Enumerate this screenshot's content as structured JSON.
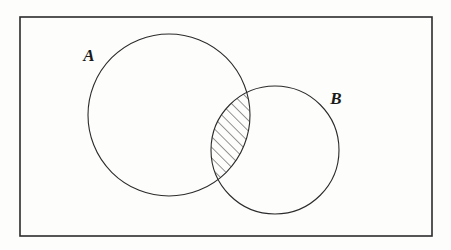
{
  "figure": {
    "kind": "venn-diagram",
    "caption": "",
    "background_color": "#fdfdfc",
    "stroke_color": "#2b2b2b"
  },
  "universe_rectangle": {
    "name": "universal-set-box",
    "x": 20,
    "y": 17,
    "width": 412,
    "height": 219,
    "stroke_width": 1.6,
    "fill": "none",
    "label": ""
  },
  "sets": [
    {
      "id": "A",
      "label": "A",
      "label_x": 89,
      "label_y": 61,
      "cx": 169,
      "cy": 115,
      "r": 81,
      "stroke_width": 1.1,
      "fill": "none"
    },
    {
      "id": "B",
      "label": "B",
      "label_x": 336,
      "label_y": 104,
      "cx": 275,
      "cy": 150,
      "r": 64,
      "stroke_width": 1.1,
      "fill": "none"
    }
  ],
  "intersection": {
    "name": "a-intersect-b",
    "shaded": true,
    "hatch_angle_degrees": 45,
    "hatch_spacing_px": 7.5,
    "hatch_stroke_width": 1.0,
    "hatch_color": "#2b2b2b",
    "label": ""
  },
  "colors": {
    "ink": "#2b2b2b",
    "paper": "#fdfdfc",
    "label_ink": "#1a1a1a"
  }
}
